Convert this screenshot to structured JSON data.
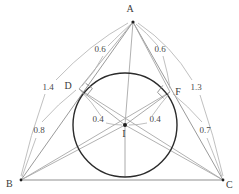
{
  "figure": {
    "background_color": "#ffffff",
    "width": 239,
    "height": 194
  },
  "points": {
    "A": {
      "label": "A",
      "x": 133,
      "y": 22,
      "label_x": 130,
      "label_y": 12
    },
    "B": {
      "label": "B",
      "x": 21,
      "y": 180,
      "label_x": 6,
      "label_y": 187
    },
    "C": {
      "label": "C",
      "x": 223,
      "y": 180,
      "label_x": 226,
      "label_y": 188
    },
    "D": {
      "label": "D",
      "x": 79,
      "y": 89,
      "label_x": 68,
      "label_y": 89
    },
    "F": {
      "label": "F",
      "x": 170,
      "y": 92,
      "label_x": 176,
      "label_y": 94
    },
    "I": {
      "label": "I",
      "x": 125,
      "y": 125,
      "label_x": 122,
      "label_y": 137
    }
  },
  "incircle": {
    "center_x": 125,
    "center_y": 125,
    "radius": 52,
    "stroke_color": "#2b2b2b"
  },
  "measures": {
    "AD": {
      "value": "0.6",
      "x": 100,
      "y": 49
    },
    "AF": {
      "value": "0.6",
      "x": 160,
      "y": 49
    },
    "AB_outer": {
      "value": "1.4",
      "x": 48,
      "y": 87
    },
    "AC_outer": {
      "value": "1.3",
      "x": 196,
      "y": 87
    },
    "BD": {
      "value": "0.8",
      "x": 40,
      "y": 130
    },
    "CF": {
      "value": "0.7",
      "x": 204,
      "y": 130
    },
    "ID": {
      "value": "0.4",
      "x": 99,
      "y": 122
    },
    "IF": {
      "value": "0.4",
      "x": 152,
      "y": 122
    }
  },
  "colors": {
    "side_stroke": "#9a9a9a",
    "base_stroke": "#b4b4b4",
    "cevian_stroke": "#a8a8a8",
    "circle_stroke": "#2b2b2b",
    "leader_stroke": "#b0b0b0",
    "label_fill": "#3a3a3a"
  },
  "markers": {
    "right_angle_D": "right-angle-square",
    "right_angle_F": "right-angle-square"
  }
}
